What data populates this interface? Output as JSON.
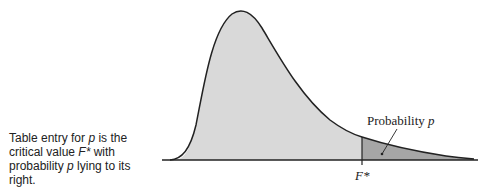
{
  "caption": {
    "part1": "Table entry for ",
    "p1": "p",
    "part2": " is the critical value ",
    "fstar": "F*",
    "part3": " with probability ",
    "p2": "p",
    "part4": " lying to its right."
  },
  "labels": {
    "probability_text": "Probability ",
    "probability_var": "p",
    "critical_value": "F*"
  },
  "colors": {
    "body_fill": "#d9d9d9",
    "tail_fill": "#a6a6a6",
    "curve": "#222222"
  }
}
